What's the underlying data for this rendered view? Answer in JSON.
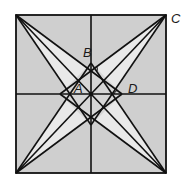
{
  "diagram": {
    "type": "geometry-figure",
    "colors": {
      "outer_fill": "#cfcfcf",
      "star_fill": "#e9e9e9",
      "inner_fill": "#d6d6d6",
      "stroke": "#111111",
      "background": "#ffffff"
    },
    "points": {
      "TL": [
        16,
        15
      ],
      "TR": [
        166,
        15
      ],
      "BL": [
        16,
        173
      ],
      "BR": [
        166,
        173
      ],
      "O": [
        91,
        94
      ],
      "B": [
        91,
        63
      ],
      "D": [
        122,
        94
      ],
      "E": [
        91,
        125
      ],
      "F": [
        60,
        94
      ]
    },
    "labels": {
      "A": "A",
      "B": "B",
      "C": "C",
      "D": "D"
    }
  }
}
